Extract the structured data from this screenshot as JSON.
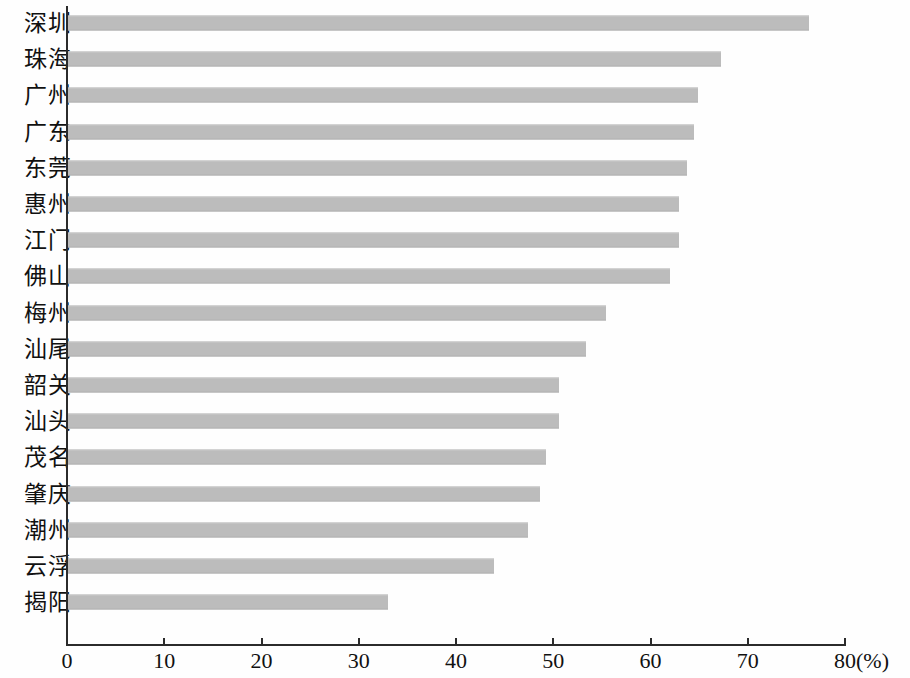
{
  "chart_data": {
    "type": "bar",
    "orientation": "horizontal",
    "title": "",
    "subtitle": "",
    "xlabel": "(%)",
    "ylabel": "",
    "unit": "(%)",
    "xlim": [
      0,
      80
    ],
    "xticks": [
      0,
      10,
      20,
      30,
      40,
      50,
      60,
      70,
      80
    ],
    "xtick_labels": [
      "0",
      "10",
      "20",
      "30",
      "40",
      "50",
      "60",
      "70",
      "80"
    ],
    "grid": false,
    "legend": false,
    "legend_position": "none",
    "bar_color": "#bcbcbc",
    "axis_color": "#2b2b2b",
    "categories": [
      "深圳",
      "珠海",
      "广州",
      "广东",
      "东莞",
      "惠州",
      "江门",
      "佛山",
      "梅州",
      "汕尾",
      "韶关",
      "汕头",
      "茂名",
      "肇庆",
      "潮州",
      "云浮",
      "揭阳"
    ],
    "values": [
      76.2,
      67.1,
      64.8,
      64.4,
      63.6,
      62.8,
      62.8,
      61.9,
      55.3,
      53.3,
      50.5,
      50.5,
      49.2,
      48.5,
      47.3,
      43.8,
      32.9
    ],
    "bars": [
      {
        "label": "深圳",
        "value": 76.2
      },
      {
        "label": "珠海",
        "value": 67.1
      },
      {
        "label": "广州",
        "value": 64.8
      },
      {
        "label": "广东",
        "value": 64.4
      },
      {
        "label": "东莞",
        "value": 63.6
      },
      {
        "label": "惠州",
        "value": 62.8
      },
      {
        "label": "江门",
        "value": 62.8
      },
      {
        "label": "佛山",
        "value": 61.9
      },
      {
        "label": "梅州",
        "value": 55.3
      },
      {
        "label": "汕尾",
        "value": 53.3
      },
      {
        "label": "韶关",
        "value": 50.5
      },
      {
        "label": "汕头",
        "value": 50.5
      },
      {
        "label": "茂名",
        "value": 49.2
      },
      {
        "label": "肇庆",
        "value": 48.5
      },
      {
        "label": "潮州",
        "value": 47.3
      },
      {
        "label": "云浮",
        "value": 43.8
      },
      {
        "label": "揭阳",
        "value": 32.9
      }
    ]
  }
}
